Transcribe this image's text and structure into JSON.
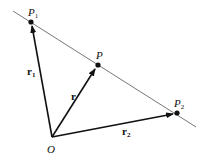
{
  "diagram": {
    "points": {
      "origin": {
        "label": "O"
      },
      "P1": {
        "label": "P",
        "sub": "1"
      },
      "P": {
        "label": "P"
      },
      "P2": {
        "label": "P",
        "sub": "2"
      }
    },
    "vectors": {
      "r1": {
        "label": "r",
        "sub": "1",
        "from": "O",
        "to": "P1"
      },
      "r": {
        "label": "r",
        "from": "O",
        "to": "P"
      },
      "r2": {
        "label": "r",
        "sub": "2",
        "from": "O",
        "to": "P2"
      }
    },
    "line": {
      "through": [
        "P1",
        "P",
        "P2"
      ]
    },
    "colors": {
      "ink": "#111111",
      "line": "#777777",
      "background": "#ffffff"
    }
  }
}
